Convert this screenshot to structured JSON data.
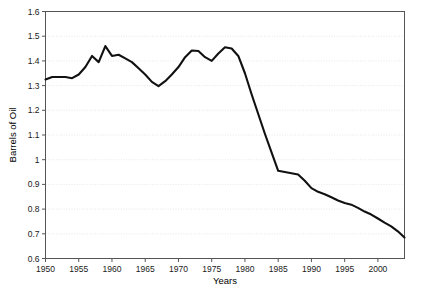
{
  "chart_data": {
    "type": "line",
    "title": "",
    "xlabel": "Years",
    "ylabel": "Barrels of Oil",
    "xlim": [
      1950,
      2004
    ],
    "ylim": [
      0.6,
      1.6
    ],
    "grid": true,
    "legend": false,
    "xticks": [
      1950,
      1955,
      1960,
      1965,
      1970,
      1975,
      1980,
      1985,
      1990,
      1995,
      2000
    ],
    "xtick_labels": [
      "1950",
      "1955",
      "1960",
      "1965",
      "1970",
      "1975",
      "1980",
      "1985",
      "1990",
      "1995",
      "2000"
    ],
    "yticks": [
      0.6,
      0.7,
      0.8,
      0.9,
      1.0,
      1.1,
      1.2,
      1.3,
      1.4,
      1.5,
      1.6
    ],
    "ytick_labels": [
      "0.6",
      "0.7",
      "0.8",
      "0.9",
      "1",
      "1.1",
      "1.2",
      "1.3",
      "1.4",
      "1.5",
      "1.6"
    ],
    "line_color": "#111111",
    "x": [
      1950,
      1951,
      1952,
      1953,
      1954,
      1955,
      1956,
      1957,
      1958,
      1959,
      1960,
      1961,
      1962,
      1963,
      1964,
      1965,
      1966,
      1967,
      1968,
      1969,
      1970,
      1971,
      1972,
      1973,
      1974,
      1975,
      1976,
      1977,
      1978,
      1979,
      1980,
      1981,
      1982,
      1983,
      1984,
      1985,
      1986,
      1987,
      1988,
      1989,
      1990,
      1991,
      1992,
      1993,
      1994,
      1995,
      1996,
      1997,
      1998,
      1999,
      2000,
      2001,
      2002,
      2003,
      2004
    ],
    "y": [
      1.325,
      1.335,
      1.335,
      1.335,
      1.33,
      1.345,
      1.375,
      1.42,
      1.395,
      1.46,
      1.42,
      1.425,
      1.41,
      1.395,
      1.37,
      1.345,
      1.315,
      1.298,
      1.318,
      1.345,
      1.375,
      1.415,
      1.442,
      1.44,
      1.415,
      1.4,
      1.43,
      1.455,
      1.45,
      1.42,
      1.35,
      1.265,
      1.185,
      1.105,
      1.03,
      0.955,
      0.95,
      0.945,
      0.94,
      0.915,
      0.885,
      0.87,
      0.86,
      0.848,
      0.835,
      0.825,
      0.818,
      0.805,
      0.79,
      0.778,
      0.762,
      0.745,
      0.73,
      0.71,
      0.685
    ]
  },
  "axis": {
    "y_title": "Barrels of Oil",
    "x_title": "Years"
  }
}
